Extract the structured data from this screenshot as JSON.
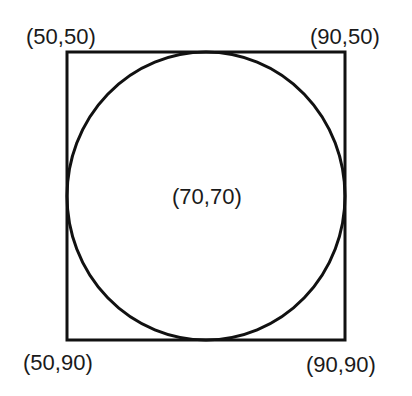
{
  "diagram": {
    "square": {
      "corners": {
        "top_left": "(50,50)",
        "top_right": "(90,50)",
        "bottom_left": "(50,90)",
        "bottom_right": "(90,90)"
      }
    },
    "circle": {
      "center_label": "(70,70)"
    },
    "colors": {
      "stroke": "#111111",
      "text": "#1a1a1a",
      "background": "#ffffff"
    }
  }
}
